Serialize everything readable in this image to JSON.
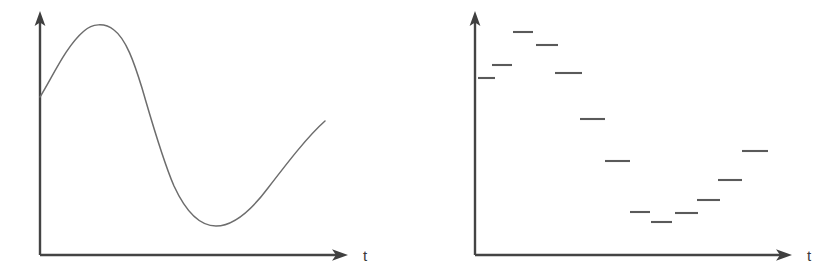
{
  "figure": {
    "background_color": "#ffffff",
    "ink_color": "#555555",
    "axis_color": "#444444",
    "panels": [
      {
        "id": "left-panel",
        "name": "continuous-signal-plot",
        "axes": {
          "x_axis_label": "t",
          "y_axis_label": "",
          "origin_x": 40,
          "origin_y": 255,
          "y_axis_top": 13,
          "x_axis_end": 347
        }
      },
      {
        "id": "right-panel",
        "name": "quantized-sampled-signal-plot",
        "axes": {
          "x_axis_label": "t",
          "y_axis_label": "",
          "origin_x": 61,
          "origin_y": 255,
          "y_axis_top": 13,
          "x_axis_end": 377
        }
      }
    ]
  },
  "chart_data": [
    {
      "type": "line",
      "title": "",
      "xlabel": "t",
      "ylabel": "",
      "name": "continuous-waveform",
      "grid": false,
      "legend": "none",
      "axis_arrows": true,
      "xlim": [
        0,
        310
      ],
      "ylim": [
        0,
        245
      ],
      "description": "Smooth continuous sinusoid-like curve rising from the y-axis to a peak, falling to a trough, then rising again",
      "x": [
        0,
        10,
        20,
        30,
        40,
        50,
        56,
        62,
        70,
        80,
        90,
        100,
        110,
        120,
        130,
        140,
        150,
        160,
        170,
        175,
        180,
        190,
        200,
        210,
        220,
        230,
        240,
        250,
        260,
        270,
        280,
        285
      ],
      "y": [
        158,
        176,
        192,
        206,
        218,
        228,
        230,
        231,
        230,
        225,
        215,
        200,
        180,
        156,
        130,
        104,
        80,
        58,
        42,
        36,
        32,
        28,
        27,
        29,
        34,
        43,
        56,
        72,
        92,
        112,
        128,
        132
      ]
    },
    {
      "type": "scatter",
      "marker": "horizontal-dash",
      "title": "",
      "xlabel": "t",
      "ylabel": "",
      "name": "quantized-staircase-samples",
      "grid": false,
      "legend": "none",
      "axis_arrows": true,
      "xlim": [
        0,
        320
      ],
      "ylim": [
        0,
        245
      ],
      "description": "Sequence of short horizontal dashes representing quantized sample-and-hold levels that generally decrease then rise at the end",
      "points": [
        {
          "index": 1,
          "x_start": 3,
          "x_end": 20,
          "y": 177
        },
        {
          "index": 2,
          "x_start": 17,
          "x_end": 37,
          "y": 190
        },
        {
          "index": 3,
          "x_start": 38,
          "x_end": 58,
          "y": 223
        },
        {
          "index": 4,
          "x_start": 61,
          "x_end": 83,
          "y": 210
        },
        {
          "index": 5,
          "x_start": 80,
          "x_end": 107,
          "y": 182
        },
        {
          "index": 6,
          "x_start": 105,
          "x_end": 130,
          "y": 136
        },
        {
          "index": 7,
          "x_start": 130,
          "x_end": 155,
          "y": 94
        },
        {
          "index": 8,
          "x_start": 155,
          "x_end": 175,
          "y": 43
        },
        {
          "index": 9,
          "x_start": 176,
          "x_end": 197,
          "y": 33
        },
        {
          "index": 10,
          "x_start": 200,
          "x_end": 223,
          "y": 42
        },
        {
          "index": 11,
          "x_start": 222,
          "x_end": 245,
          "y": 55
        },
        {
          "index": 12,
          "x_start": 243,
          "x_end": 267,
          "y": 75
        },
        {
          "index": 13,
          "x_start": 267,
          "x_end": 293,
          "y": 104
        }
      ]
    }
  ]
}
